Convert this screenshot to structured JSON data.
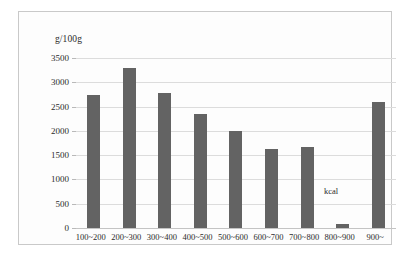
{
  "chart_data": {
    "type": "bar",
    "title": "",
    "subtitle": "",
    "xlabel": "kcal",
    "ylabel": "g/100g",
    "categories": [
      "100~200",
      "200~300",
      "300~400",
      "400~500",
      "500~600",
      "600~700",
      "700~800",
      "800~900",
      "900~"
    ],
    "values": [
      2730,
      3300,
      2770,
      2340,
      1990,
      1630,
      1670,
      80,
      2590
    ],
    "ylim": [
      0,
      3500
    ],
    "ytick_labels": [
      "0",
      "500",
      "1000",
      "1500",
      "2000",
      "2500",
      "3000",
      "3500"
    ],
    "ytick_values": [
      0,
      500,
      1000,
      1500,
      2000,
      2500,
      3000,
      3500
    ],
    "grid": true,
    "legend": false,
    "legend_position": "none",
    "bar_color": "#636363",
    "gridline_color": "#dcdcdc",
    "axis_color": "#c4c4c4",
    "frame_color": "#c9c9c9",
    "background_color": "#fdfdfd",
    "text_color": "#2b2b2b"
  }
}
